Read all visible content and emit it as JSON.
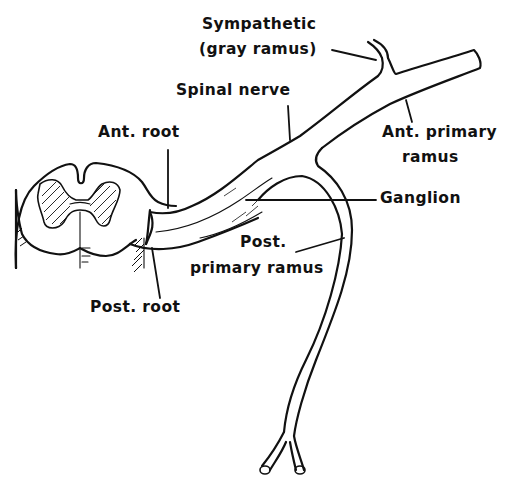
{
  "diagram": {
    "labels": {
      "sympathetic_line1": "Sympathetic",
      "sympathetic_line2": "(gray ramus)",
      "spinal_nerve": "Spinal nerve",
      "ant_root": "Ant. root",
      "ant_primary_line1": "Ant. primary",
      "ant_primary_line2": "ramus",
      "ganglion": "Ganglion",
      "post_primary_line1": "Post.",
      "post_primary_line2": "primary ramus",
      "post_root": "Post. root"
    },
    "colors": {
      "ink": "#111111",
      "background": "#ffffff"
    }
  }
}
